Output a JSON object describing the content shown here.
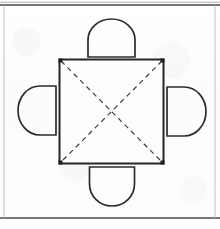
{
  "figure": {
    "title": "Square table with four chairs, diagonals shown dashed",
    "width": 220,
    "height": 229,
    "background_color": "#fdfdfc",
    "ink_color": "#2b2b2b",
    "frame_color": "#4a4a4a"
  },
  "frame": {
    "top_rule": {
      "y": 5,
      "x1": 0,
      "x2": 220,
      "stroke_width": 1.6
    },
    "bottom_rule": {
      "y": 218,
      "x1": 0,
      "x2": 220,
      "stroke_width": 1.3
    },
    "left_rule": {
      "x": 4,
      "y1": 5,
      "y2": 218,
      "stroke_width": 0.8
    },
    "right_rule": {
      "x": 215,
      "y1": 5,
      "y2": 218,
      "stroke_width": 0.8
    }
  },
  "table": {
    "label": "square-table",
    "shape": "square",
    "x": 59,
    "y": 59,
    "width": 105,
    "height": 105,
    "stroke_width": 2.0,
    "fill": "none"
  },
  "diagonals": {
    "label": "table-diagonals",
    "style": "dashed",
    "dash_pattern": "5 4",
    "stroke_width": 1.2,
    "lines": [
      {
        "name": "diagonal-tl-br",
        "x1": 61,
        "y1": 61,
        "x2": 162,
        "y2": 162
      },
      {
        "name": "diagonal-tr-bl",
        "x1": 162,
        "y1": 61,
        "x2": 61,
        "y2": 162
      }
    ],
    "intersection": {
      "x": 111.5,
      "y": 111.5
    }
  },
  "chairs": [
    {
      "name": "chair-top",
      "position": "top",
      "cx": 111.5,
      "cy": 37,
      "rx": 23.5,
      "ry": 21,
      "flat_edge": "bottom",
      "flat_y": 57,
      "stroke_width": 1.7
    },
    {
      "name": "chair-left",
      "position": "left",
      "cx": 35,
      "cy": 110.5,
      "rx": 22,
      "ry": 24.5,
      "flat_edge": "right",
      "flat_x": 56,
      "stroke_width": 1.7
    },
    {
      "name": "chair-right",
      "position": "right",
      "cx": 188,
      "cy": 111.5,
      "rx": 22,
      "ry": 24.5,
      "flat_edge": "left",
      "flat_x": 167,
      "stroke_width": 1.7
    },
    {
      "name": "chair-bottom",
      "position": "bottom",
      "cx": 112,
      "cy": 188,
      "rx": 22.5,
      "ry": 22,
      "flat_edge": "top",
      "flat_y": 167,
      "stroke_width": 1.7
    }
  ]
}
